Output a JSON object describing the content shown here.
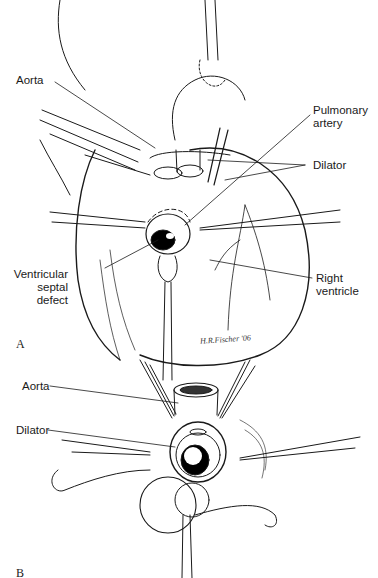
{
  "figure": {
    "panel_a": {
      "letter": "A",
      "labels": {
        "aorta": "Aorta",
        "pulmonary_artery_1": "Pulmonary",
        "pulmonary_artery_2": "artery",
        "dilator": "Dilator",
        "vsd_1": "Ventricular",
        "vsd_2": "septal",
        "vsd_3": "defect",
        "rv_1": "Right",
        "rv_2": "ventricle"
      },
      "signature": "H.R.Fischer '06"
    },
    "panel_b": {
      "letter": "B",
      "labels": {
        "aorta": "Aorta",
        "dilator": "Dilator"
      }
    }
  },
  "colors": {
    "ink": "#1a1a1a",
    "background": "#ffffff",
    "shade": "#000000"
  }
}
